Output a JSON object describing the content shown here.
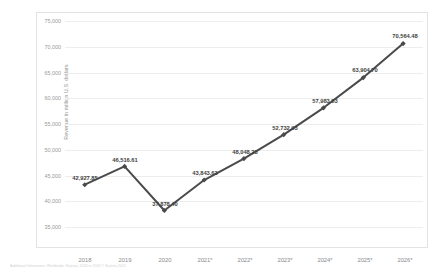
{
  "chart_data": {
    "type": "line",
    "title": "",
    "xlabel": "",
    "ylabel": "Revenue in million U.S. dollars",
    "categories": [
      "2018",
      "2019",
      "2020",
      "2021*",
      "2022*",
      "2023*",
      "2024*",
      "2025*",
      "2026*"
    ],
    "values": [
      42927.85,
      46516.61,
      37878.4,
      43843.63,
      48048.23,
      52732.93,
      57983.53,
      63904.7,
      70564.48
    ],
    "point_labels": [
      "42,927.85",
      "46,516.61",
      "37,878.40",
      "43,843.63",
      "48,048.23",
      "52,732.93",
      "57,983.53",
      "63,904.70",
      "70,564.48"
    ],
    "ylim": [
      35000,
      75000
    ],
    "yticks": [
      35000,
      40000,
      45000,
      50000,
      55000,
      60000,
      65000,
      70000,
      75000
    ],
    "ytick_labels": [
      "35,000",
      "40,000",
      "45,000",
      "50,000",
      "55,000",
      "60,000",
      "65,000",
      "70,000",
      "75,000"
    ],
    "grid": true,
    "legend": "none",
    "series_color": "#4a4a4a",
    "grid_color": "#ededed",
    "marker": "diamond"
  },
  "footer": {
    "note": "Additional Information: Worldwide; Statista; 2018 to 2020  © Statista 2021"
  }
}
